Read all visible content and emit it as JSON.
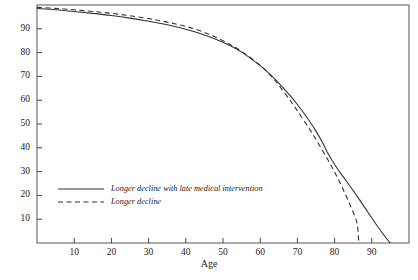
{
  "chart_data": {
    "type": "line",
    "title": "",
    "subtitle": "",
    "xlabel": "Age",
    "ylabel": "",
    "xlim": [
      0,
      100
    ],
    "ylim": [
      0,
      100
    ],
    "grid": false,
    "legend_position": "inside-lower-left",
    "x_ticks": [
      10,
      20,
      30,
      40,
      50,
      60,
      70,
      80,
      90
    ],
    "y_ticks": [
      10,
      20,
      30,
      40,
      50,
      60,
      70,
      80,
      90
    ],
    "x_tick_labels": [
      "10",
      "20",
      "30",
      "40",
      "50",
      "60",
      "70",
      "80",
      "90"
    ],
    "y_tick_labels": [
      "10",
      "20",
      "30",
      "40",
      "50",
      "60",
      "70",
      "80",
      "90"
    ],
    "series": [
      {
        "name": "Longer decline with late medical intervention",
        "style": "solid",
        "color": "#333333",
        "x": [
          0,
          5,
          10,
          15,
          20,
          25,
          30,
          35,
          40,
          45,
          50,
          55,
          60,
          63,
          65,
          68,
          70,
          73,
          75,
          77,
          78,
          80,
          82,
          85,
          88,
          90,
          92,
          94,
          95
        ],
        "y": [
          98.5,
          98.0,
          97.3,
          96.5,
          95.6,
          94.5,
          93.2,
          91.7,
          89.8,
          87.4,
          84.3,
          80.2,
          74.5,
          70.3,
          67.2,
          62.0,
          58.2,
          51.8,
          47.0,
          41.5,
          38.2,
          33.0,
          28.5,
          22.0,
          15.2,
          10.5,
          6.0,
          1.8,
          0
        ]
      },
      {
        "name": "Longer decline",
        "style": "dashed",
        "color": "#333333",
        "x": [
          0,
          5,
          10,
          15,
          20,
          25,
          30,
          35,
          40,
          45,
          50,
          55,
          60,
          63,
          65,
          68,
          70,
          73,
          75,
          78,
          80,
          82,
          84,
          86,
          86.5
        ],
        "y": [
          99.0,
          98.6,
          98.0,
          97.3,
          96.5,
          95.5,
          94.3,
          92.8,
          91.0,
          88.5,
          85.0,
          80.5,
          74.6,
          70.0,
          66.3,
          60.0,
          55.5,
          48.5,
          43.5,
          35.5,
          29.8,
          23.5,
          16.5,
          8.5,
          0
        ]
      }
    ],
    "legend_entries": [
      {
        "label": "Longer decline with late medical intervention",
        "style": "solid"
      },
      {
        "label": "Longer decline",
        "style": "dashed"
      }
    ]
  },
  "colors": {
    "axis": "#444444",
    "frame": "#555555",
    "line": "#333333",
    "text": "#1a1a1a",
    "background": "#ffffff"
  }
}
